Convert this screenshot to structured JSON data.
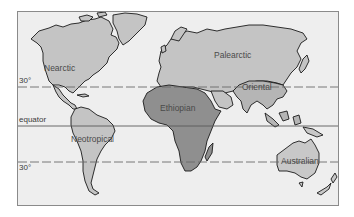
{
  "map": {
    "title": "",
    "realms": [
      {
        "id": "nearctic",
        "label": "Nearctic",
        "fill": "#c4c4c4"
      },
      {
        "id": "palearctic",
        "label": "Palearctic",
        "fill": "#c4c4c4"
      },
      {
        "id": "oriental",
        "label": "Oriental",
        "fill": "#b5b5b5"
      },
      {
        "id": "ethiopian",
        "label": "Ethiopian",
        "fill": "#8f8f8f"
      },
      {
        "id": "neotropical",
        "label": "Neotropical",
        "fill": "#c4c4c4"
      },
      {
        "id": "australian",
        "label": "Australian",
        "fill": "#c8c8c8"
      }
    ],
    "latitude_lines": [
      {
        "id": "30n",
        "label": "30°",
        "style": "dashed"
      },
      {
        "id": "equator",
        "label": "equator",
        "style": "solid"
      },
      {
        "id": "30s",
        "label": "30°",
        "style": "dashed"
      }
    ],
    "colors": {
      "ocean": "#eeeeee",
      "land_light": "#c4c4c4",
      "land_dark": "#8f8f8f",
      "coastline": "#1a1a1a",
      "frame": "#8a8a8a"
    }
  }
}
